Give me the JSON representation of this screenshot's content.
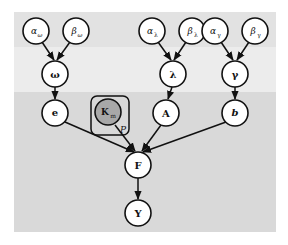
{
  "diagram": {
    "type": "probabilistic-graphical-model",
    "bands": [
      {
        "name": "hyperparameters",
        "color": "#e2e2e2"
      },
      {
        "name": "parameters",
        "color": "#ececec"
      },
      {
        "name": "variables",
        "color": "#d9d9d9"
      }
    ],
    "nodes": {
      "alpha_omega": {
        "label": "α",
        "sub": "ω"
      },
      "beta_omega": {
        "label": "β",
        "sub": "ω"
      },
      "omega": {
        "label": "ω"
      },
      "e": {
        "label": "e"
      },
      "K_m": {
        "label": "K",
        "sub": "m",
        "observed": true
      },
      "alpha_lambda": {
        "label": "α",
        "sub": "λ"
      },
      "beta_lambda": {
        "label": "β",
        "sub": "λ"
      },
      "lambda": {
        "label": "λ"
      },
      "A": {
        "label": "A"
      },
      "alpha_gamma": {
        "label": "α",
        "sub": "γ"
      },
      "beta_gamma": {
        "label": "β",
        "sub": "γ"
      },
      "gamma": {
        "label": "γ"
      },
      "b": {
        "label": "b"
      },
      "F": {
        "label": "F"
      },
      "Y": {
        "label": "Y"
      }
    },
    "plate": {
      "label": "P",
      "contains": [
        "K_m"
      ]
    },
    "edges": [
      [
        "alpha_omega",
        "omega"
      ],
      [
        "beta_omega",
        "omega"
      ],
      [
        "omega",
        "e"
      ],
      [
        "alpha_lambda",
        "lambda"
      ],
      [
        "beta_lambda",
        "lambda"
      ],
      [
        "lambda",
        "A"
      ],
      [
        "alpha_gamma",
        "gamma"
      ],
      [
        "beta_gamma",
        "gamma"
      ],
      [
        "gamma",
        "b"
      ],
      [
        "e",
        "F"
      ],
      [
        "K_m",
        "F"
      ],
      [
        "A",
        "F"
      ],
      [
        "b",
        "F"
      ],
      [
        "F",
        "Y"
      ]
    ]
  }
}
